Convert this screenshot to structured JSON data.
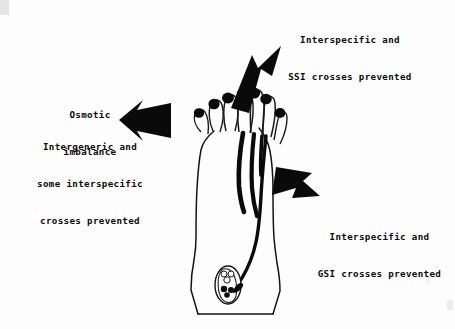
{
  "figure": {
    "kind": "scanned-botanical-diagram",
    "background_color": "#fdfdfd",
    "ink_color": "#0a0a0a"
  },
  "annotations": [
    {
      "id": "ssi",
      "lines": [
        "Interspecific and",
        "SSI crosses prevented"
      ],
      "position": "top-right",
      "arrow": "northeast-arrow",
      "points_at": "stigma-surface"
    },
    {
      "id": "osmotic",
      "lines": [
        "Osmotic",
        "imbalance"
      ],
      "position": "left-upper",
      "arrow": "west-arrow",
      "points_at": "stigma-papillae"
    },
    {
      "id": "intergeneric",
      "lines": [
        "Intergeneric and",
        "some interspecific",
        "crosses prevented"
      ],
      "position": "left-lower",
      "arrow": "west-arrow",
      "points_at": "stigma-papillae"
    },
    {
      "id": "gsi",
      "lines": [
        "Interspecific and",
        "GSI crosses prevented"
      ],
      "position": "right-lower",
      "arrow": "southeast-arrow",
      "points_at": "style-transmitting-tissue"
    }
  ],
  "arrows": [
    {
      "id": "northeast-arrow",
      "direction": "up-right",
      "fill": "#0a0a0a"
    },
    {
      "id": "west-arrow",
      "direction": "left",
      "fill": "#0a0a0a"
    },
    {
      "id": "southeast-arrow",
      "direction": "down-right",
      "fill": "#0a0a0a"
    }
  ],
  "pistil": {
    "parts": [
      "stigma",
      "style",
      "ovary",
      "ovule",
      "embryo-sac"
    ],
    "pollen_grain_count": 7,
    "pollen_tubes": {
      "arrested_on_stigma": 4,
      "arrested_in_style": 2,
      "reaching_ovule": 1
    },
    "ovule": {
      "nucellus_cells": 3,
      "egg_apparatus_nuclei": 3
    }
  }
}
